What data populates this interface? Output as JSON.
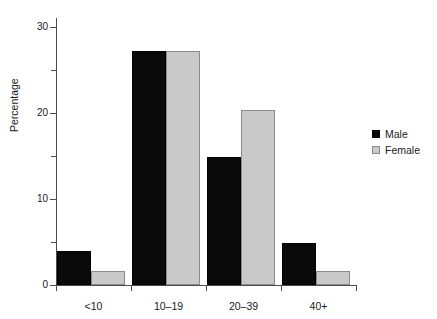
{
  "chart_data": {
    "type": "bar",
    "title": "",
    "xlabel": "",
    "ylabel": "Percentage",
    "ylim": [
      0,
      31
    ],
    "yticks": [
      0,
      10,
      20,
      30
    ],
    "ytick_labels": [
      "0",
      "10",
      "20",
      "30"
    ],
    "yminor_ticks": [
      5,
      15,
      25
    ],
    "grid": false,
    "categories": [
      "<10",
      "10–19",
      "20–39",
      "40+"
    ],
    "legend_position": "right",
    "series": [
      {
        "name": "Male",
        "color": "#0a0a0a",
        "values": [
          4.0,
          27.2,
          14.9,
          4.9
        ]
      },
      {
        "name": "Female",
        "color": "#c9c9c9",
        "values": [
          1.6,
          27.2,
          20.3,
          1.6
        ]
      }
    ]
  },
  "axis": {
    "y_title": "Percentage",
    "y_labels": [
      "30",
      "20",
      "10",
      "0"
    ],
    "x_labels": [
      "<10",
      "10–19",
      "20–39",
      "40+"
    ]
  },
  "legend": {
    "items": [
      {
        "label": "Male"
      },
      {
        "label": "Female"
      }
    ]
  }
}
